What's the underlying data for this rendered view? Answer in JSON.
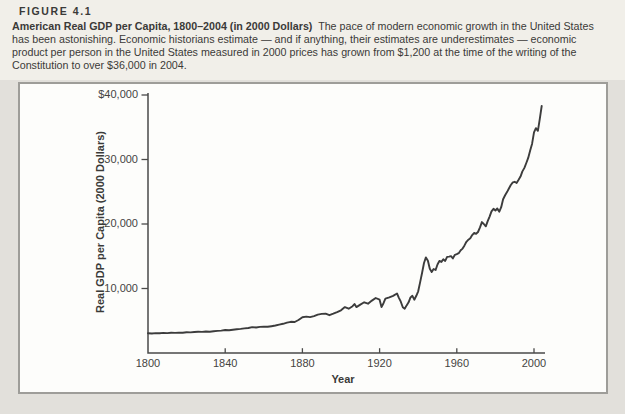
{
  "figure": {
    "label": "FIGURE 4.1",
    "title": "American Real GDP per Capita, 1800–2004 (in 2000 Dollars)",
    "caption": "The pace of modern economic growth in the United States has been astonishing. Economic historians estimate — and if anything, their estimates are underestimates — economic product per person in the United States measured in 2000 prices has grown from $1,200 at the time of the writing of the Constitution to over $36,000 in 2004."
  },
  "colors": {
    "page_bg": "#e2e0db",
    "header_bg": "#f1efe9",
    "panel_bg": "#fdfdfb",
    "panel_border": "#9e9d99",
    "axis": "#4a4a49",
    "line": "#3c3c3c",
    "ink": "#3a3a38"
  },
  "chart_data": {
    "type": "line",
    "title": "",
    "xlabel": "Year",
    "ylabel": "Real GDP per Capita (2000 Dollars)",
    "xlim": [
      1800,
      2004
    ],
    "ylim": [
      0,
      40000
    ],
    "grid": false,
    "legend": false,
    "x_ticks": [
      {
        "label": "1800",
        "value": 1800
      },
      {
        "label": "1840",
        "value": 1840
      },
      {
        "label": "1880",
        "value": 1880
      },
      {
        "label": "1920",
        "value": 1920
      },
      {
        "label": "1960",
        "value": 1960
      },
      {
        "label": "2000",
        "value": 2000
      }
    ],
    "y_ticks": [
      {
        "label": "$40,000",
        "value": 40000
      },
      {
        "label": "30,000",
        "value": 30000
      },
      {
        "label": "20,000",
        "value": 20000
      },
      {
        "label": "10,000",
        "value": 10000
      }
    ],
    "series_name": "Real GDP per capita (2000 dollars)",
    "points": [
      [
        1800,
        3050
      ],
      [
        1802,
        3020
      ],
      [
        1804,
        3080
      ],
      [
        1806,
        3060
      ],
      [
        1808,
        3110
      ],
      [
        1810,
        3090
      ],
      [
        1812,
        3140
      ],
      [
        1814,
        3120
      ],
      [
        1816,
        3170
      ],
      [
        1818,
        3150
      ],
      [
        1820,
        3210
      ],
      [
        1822,
        3190
      ],
      [
        1824,
        3250
      ],
      [
        1826,
        3290
      ],
      [
        1828,
        3270
      ],
      [
        1830,
        3330
      ],
      [
        1832,
        3310
      ],
      [
        1834,
        3380
      ],
      [
        1836,
        3430
      ],
      [
        1838,
        3470
      ],
      [
        1840,
        3560
      ],
      [
        1842,
        3540
      ],
      [
        1844,
        3620
      ],
      [
        1846,
        3670
      ],
      [
        1848,
        3730
      ],
      [
        1850,
        3810
      ],
      [
        1852,
        3880
      ],
      [
        1854,
        4010
      ],
      [
        1856,
        3950
      ],
      [
        1858,
        4040
      ],
      [
        1860,
        4100
      ],
      [
        1862,
        4060
      ],
      [
        1864,
        4160
      ],
      [
        1866,
        4260
      ],
      [
        1868,
        4400
      ],
      [
        1870,
        4520
      ],
      [
        1872,
        4700
      ],
      [
        1874,
        4830
      ],
      [
        1876,
        4800
      ],
      [
        1878,
        5120
      ],
      [
        1880,
        5550
      ],
      [
        1882,
        5640
      ],
      [
        1884,
        5570
      ],
      [
        1886,
        5720
      ],
      [
        1888,
        5950
      ],
      [
        1890,
        6060
      ],
      [
        1892,
        6100
      ],
      [
        1894,
        5860
      ],
      [
        1896,
        6100
      ],
      [
        1898,
        6340
      ],
      [
        1900,
        6620
      ],
      [
        1902,
        7120
      ],
      [
        1904,
        6870
      ],
      [
        1906,
        7250
      ],
      [
        1907,
        7600
      ],
      [
        1908,
        7120
      ],
      [
        1910,
        7500
      ],
      [
        1912,
        7860
      ],
      [
        1914,
        7640
      ],
      [
        1916,
        8120
      ],
      [
        1918,
        8520
      ],
      [
        1920,
        8260
      ],
      [
        1921,
        7120
      ],
      [
        1922,
        7720
      ],
      [
        1923,
        8420
      ],
      [
        1925,
        8620
      ],
      [
        1927,
        8860
      ],
      [
        1929,
        9220
      ],
      [
        1930,
        8560
      ],
      [
        1931,
        7960
      ],
      [
        1932,
        7100
      ],
      [
        1933,
        6870
      ],
      [
        1934,
        7380
      ],
      [
        1935,
        7860
      ],
      [
        1936,
        8620
      ],
      [
        1937,
        8870
      ],
      [
        1938,
        8260
      ],
      [
        1939,
        8870
      ],
      [
        1940,
        9560
      ],
      [
        1941,
        10950
      ],
      [
        1942,
        12450
      ],
      [
        1943,
        13950
      ],
      [
        1944,
        14820
      ],
      [
        1945,
        14300
      ],
      [
        1946,
        13050
      ],
      [
        1947,
        12580
      ],
      [
        1948,
        13020
      ],
      [
        1949,
        12870
      ],
      [
        1950,
        13720
      ],
      [
        1951,
        14280
      ],
      [
        1952,
        14120
      ],
      [
        1953,
        14520
      ],
      [
        1954,
        14280
      ],
      [
        1955,
        14900
      ],
      [
        1956,
        14950
      ],
      [
        1957,
        15020
      ],
      [
        1958,
        14660
      ],
      [
        1959,
        15220
      ],
      [
        1960,
        15320
      ],
      [
        1961,
        15480
      ],
      [
        1962,
        15920
      ],
      [
        1963,
        16180
      ],
      [
        1964,
        16680
      ],
      [
        1965,
        17240
      ],
      [
        1966,
        17560
      ],
      [
        1967,
        17780
      ],
      [
        1968,
        18280
      ],
      [
        1969,
        18620
      ],
      [
        1970,
        18480
      ],
      [
        1971,
        18760
      ],
      [
        1972,
        19480
      ],
      [
        1973,
        20300
      ],
      [
        1974,
        20000
      ],
      [
        1975,
        19650
      ],
      [
        1976,
        20450
      ],
      [
        1977,
        21150
      ],
      [
        1978,
        21950
      ],
      [
        1979,
        22350
      ],
      [
        1980,
        22100
      ],
      [
        1981,
        22400
      ],
      [
        1982,
        21900
      ],
      [
        1983,
        22600
      ],
      [
        1984,
        23850
      ],
      [
        1985,
        24450
      ],
      [
        1986,
        24950
      ],
      [
        1987,
        25500
      ],
      [
        1988,
        26050
      ],
      [
        1989,
        26450
      ],
      [
        1990,
        26550
      ],
      [
        1991,
        26350
      ],
      [
        1992,
        26850
      ],
      [
        1993,
        27350
      ],
      [
        1994,
        28150
      ],
      [
        1995,
        28700
      ],
      [
        1996,
        29450
      ],
      [
        1997,
        30250
      ],
      [
        1998,
        31350
      ],
      [
        1999,
        32450
      ],
      [
        2000,
        34200
      ],
      [
        2001,
        34850
      ],
      [
        2002,
        34450
      ],
      [
        2003,
        36300
      ],
      [
        2004,
        38300
      ]
    ]
  }
}
